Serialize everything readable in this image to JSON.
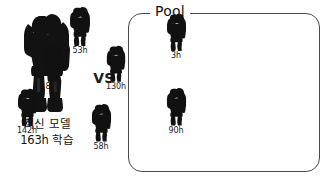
{
  "challenger": {
    "figure_icon": "robot-silhouette-icon",
    "label_line1": "최신 모델",
    "label_line2": "163h 학습"
  },
  "versus": {
    "label": "VS"
  },
  "pool": {
    "legend": "Pool",
    "members": [
      {
        "label": "53h",
        "figure_icon": "robot-silhouette-icon",
        "x": 185,
        "y": 19,
        "scale": 1.0
      },
      {
        "label": "3h",
        "figure_icon": "robot-silhouette-icon",
        "x": 281,
        "y": 26,
        "scale": 0.95
      },
      {
        "label": "87h",
        "figure_icon": "robot-silhouette-icon",
        "x": 158,
        "y": 58,
        "scale": 0.92
      },
      {
        "label": "130h",
        "figure_icon": "robot-silhouette-icon",
        "x": 221,
        "y": 58,
        "scale": 0.92
      },
      {
        "label": "142h",
        "figure_icon": "robot-silhouette-icon",
        "x": 132,
        "y": 101,
        "scale": 0.95
      },
      {
        "label": "58h",
        "figure_icon": "robot-silhouette-icon",
        "x": 206,
        "y": 116,
        "scale": 0.98
      },
      {
        "label": "90h",
        "figure_icon": "robot-silhouette-icon",
        "x": 281,
        "y": 100,
        "scale": 0.98
      }
    ]
  },
  "colors": {
    "figure": "#111111",
    "box_border": "#4a4a4a",
    "text": "#141414",
    "background": "#ffffff"
  }
}
